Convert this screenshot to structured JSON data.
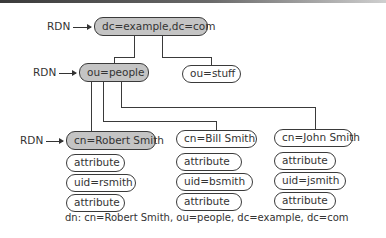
{
  "diagram": {
    "rdn_label": "RDN",
    "root": {
      "label": "dc=example,dc=com",
      "rdn": true
    },
    "ous": [
      {
        "label": "ou=people",
        "rdn": true
      },
      {
        "label": "ou=stuff",
        "rdn": false
      }
    ],
    "entries": [
      {
        "label": "cn=Robert Smith",
        "rdn": true,
        "attributes": [
          "attribute",
          "uid=rsmith",
          "attribute"
        ]
      },
      {
        "label": "cn=Bill Smith",
        "rdn": false,
        "attributes": [
          "attribute",
          "uid=bsmith",
          "attribute"
        ]
      },
      {
        "label": "cn=John Smith",
        "rdn": false,
        "attributes": [
          "attribute",
          "uid=jsmith",
          "attribute"
        ]
      }
    ],
    "caption": "dn: cn=Robert Smith, ou=people, dc=example, dc=com",
    "colors": {
      "rdn_fill": "#c4c4c4",
      "node_fill": "#ffffff",
      "stroke": "#3a3a3a",
      "text": "#333333"
    }
  }
}
